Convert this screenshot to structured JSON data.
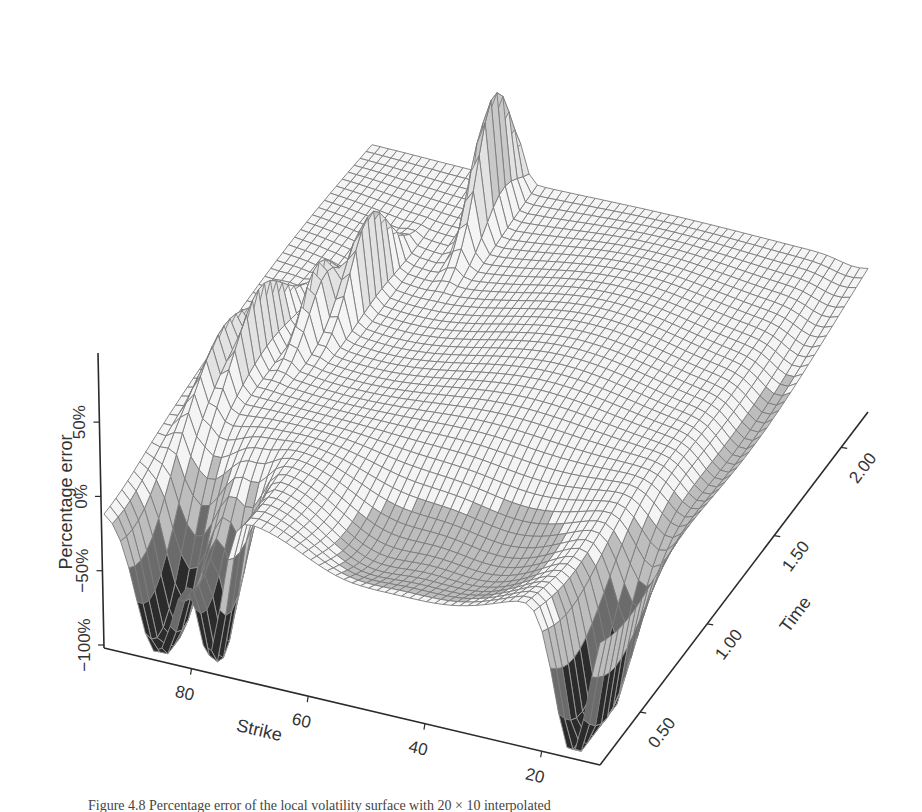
{
  "chart_data": {
    "type": "surface",
    "title": "",
    "caption": "Figure 4.8  Percentage error of the local volatility surface with 20 × 10 interpolated",
    "zlabel": "Percentage error",
    "xlabel": "Strike",
    "ylabel": "Time",
    "z_ticks": [
      "50%",
      "0%",
      "−50%",
      "−100%"
    ],
    "z_tick_values": [
      50,
      0,
      -50,
      -100
    ],
    "x_ticks": [
      "80",
      "60",
      "40",
      "20"
    ],
    "x_tick_values": [
      80,
      60,
      40,
      20
    ],
    "y_ticks": [
      "0.50",
      "1.00",
      "1.50",
      "2.00"
    ],
    "y_tick_values": [
      0.5,
      1.0,
      1.5,
      2.0
    ],
    "xlim": [
      10,
      95
    ],
    "ylim": [
      0.2,
      2.2
    ],
    "zlim": [
      -100,
      75
    ],
    "grid": false,
    "legend": null,
    "style": "wireframe mesh, gray shading",
    "features": [
      {
        "region": "strike 80-90, short time",
        "description": "deep negative pits near -100%"
      },
      {
        "region": "strike 10-20, short time",
        "description": "deep negative pit near -100%"
      },
      {
        "region": "strike 60-80, long time",
        "description": "sharp positive spikes up to ~+75%"
      },
      {
        "region": "strike 20-60, mid-long time",
        "description": "flat plateau near 0%"
      }
    ]
  },
  "colors": {
    "mesh": "#7a7a7a",
    "mesh_dark": "#1e1e1e",
    "mesh_light": "#d8d8d8",
    "axis": "#2a2a2a",
    "background": "#ffffff"
  }
}
